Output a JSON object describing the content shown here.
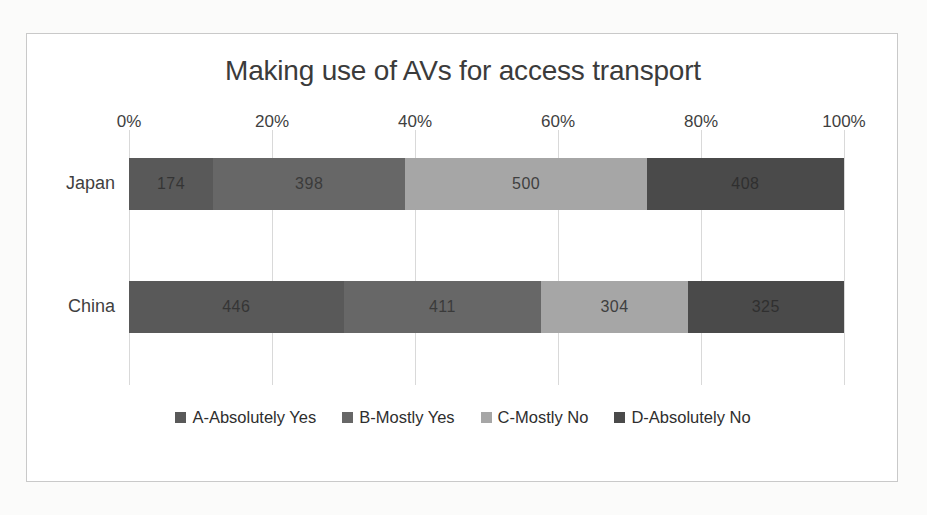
{
  "chart_data": {
    "type": "bar",
    "orientation": "horizontal",
    "stacked": true,
    "stack_mode": "100%",
    "title": "Making use of AVs for access transport",
    "xlabel": "",
    "ylabel": "",
    "categories": [
      "Japan",
      "China"
    ],
    "xlim": [
      0,
      100
    ],
    "xticks": [
      "0%",
      "20%",
      "40%",
      "60%",
      "80%",
      "100%"
    ],
    "xtick_values": [
      0,
      20,
      40,
      60,
      80,
      100
    ],
    "grid": true,
    "legend_position": "bottom",
    "series": [
      {
        "name": "A-Absolutely Yes",
        "color": "#595959",
        "tone": "dark",
        "values": [
          174,
          446
        ]
      },
      {
        "name": "B-Mostly Yes",
        "color": "#676767",
        "tone": "dark",
        "values": [
          398,
          411
        ]
      },
      {
        "name": "C-Mostly No",
        "color": "#a6a6a6",
        "tone": "light",
        "values": [
          500,
          304
        ]
      },
      {
        "name": "D-Absolutely No",
        "color": "#4a4a4a",
        "tone": "dark",
        "values": [
          408,
          325
        ]
      }
    ],
    "row_totals": [
      1480,
      1486
    ]
  }
}
